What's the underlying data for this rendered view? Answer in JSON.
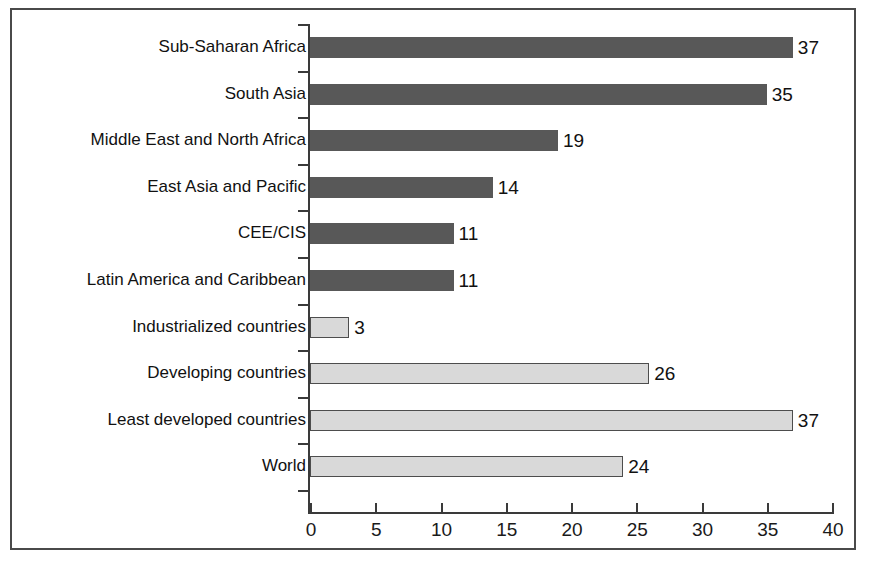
{
  "chart_data": {
    "type": "bar",
    "orientation": "horizontal",
    "title": "",
    "subtitle": "",
    "xlabel": "",
    "ylabel": "",
    "xlim": [
      0,
      40
    ],
    "xticks": [
      0,
      5,
      10,
      15,
      20,
      25,
      30,
      35,
      40
    ],
    "xtick_labels": [
      "0",
      "5",
      "10",
      "15",
      "20",
      "25",
      "30",
      "35",
      "40"
    ],
    "grid": false,
    "legend": false,
    "legend_position": "none",
    "categories": [
      "Sub-Saharan Africa",
      "South Asia",
      "Middle East and North Africa",
      "East Asia and Pacific",
      "CEE/CIS",
      "Latin America and Caribbean",
      "Industrialized countries",
      "Developing countries",
      "Least developed countries",
      "World"
    ],
    "values": [
      37,
      35,
      19,
      14,
      11,
      11,
      3,
      26,
      37,
      24
    ],
    "value_labels": [
      "37",
      "35",
      "19",
      "14",
      "11",
      "11",
      "3",
      "26",
      "37",
      "24"
    ],
    "bar_styles": [
      "dark",
      "dark",
      "dark",
      "dark",
      "dark",
      "dark",
      "light",
      "light",
      "light",
      "light"
    ],
    "colors": {
      "dark_bar": "#585858",
      "light_bar": "#d9d9d9",
      "light_bar_edge": "#4d4d4d",
      "axis": "#3a3a3a",
      "frame": "#4a4a4a",
      "text": "#111111",
      "background": "#ffffff"
    }
  }
}
